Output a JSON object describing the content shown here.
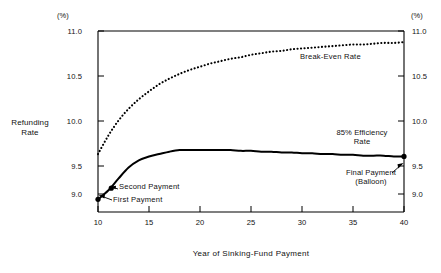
{
  "chart_data": {
    "type": "line",
    "title": "",
    "subtitle": "",
    "xlabel": "Year of Sinking-Fund Payment",
    "ylabel": "Refunding Rate",
    "unit_left": "(%)",
    "unit_right": "(%)",
    "xlim": [
      10,
      40
    ],
    "ylim": [
      8.72,
      11.0
    ],
    "grid": false,
    "legend_position": "inline-annotations",
    "xticks": [
      10,
      15,
      20,
      25,
      30,
      35,
      40
    ],
    "xtick_labels": [
      "10",
      "15",
      "20",
      "25",
      "30",
      "35",
      "40"
    ],
    "yticks": [
      11.0,
      10.5,
      10.0,
      9.5,
      9.0
    ],
    "ytick_labels": [
      "11.0",
      "10.5",
      "10.0",
      "9.5",
      "9.0"
    ],
    "ytick_labels_right": [
      "11.0",
      "10.5",
      "10.0",
      "9.5",
      "9.0"
    ],
    "series": [
      {
        "name": "Break-Even Rate",
        "style": "dotted",
        "color": "#000000",
        "x": [
          10,
          11,
          12,
          13,
          14,
          15,
          16,
          17,
          18,
          19,
          20,
          21,
          22,
          23,
          24,
          25,
          26,
          27,
          28,
          29,
          30,
          31,
          32,
          33,
          34,
          35,
          36,
          37,
          38,
          39,
          40
        ],
        "values": [
          9.45,
          9.68,
          9.87,
          10.02,
          10.14,
          10.24,
          10.33,
          10.4,
          10.46,
          10.51,
          10.55,
          10.59,
          10.62,
          10.65,
          10.67,
          10.7,
          10.72,
          10.74,
          10.75,
          10.77,
          10.78,
          10.79,
          10.8,
          10.81,
          10.82,
          10.83,
          10.83,
          10.84,
          10.85,
          10.85,
          10.86
        ]
      },
      {
        "name": "85% Efficiency Rate",
        "style": "solid",
        "color": "#000000",
        "x": [
          10,
          11,
          12,
          13,
          14,
          15,
          16,
          17,
          18,
          19,
          20,
          21,
          22,
          23,
          24,
          25,
          26,
          27,
          28,
          29,
          30,
          31,
          32,
          33,
          34,
          35,
          36,
          37,
          38,
          39,
          40
        ],
        "values": [
          8.88,
          8.99,
          9.14,
          9.28,
          9.37,
          9.42,
          9.45,
          9.48,
          9.5,
          9.5,
          9.5,
          9.5,
          9.5,
          9.5,
          9.49,
          9.49,
          9.48,
          9.48,
          9.47,
          9.47,
          9.46,
          9.46,
          9.45,
          9.45,
          9.44,
          9.44,
          9.43,
          9.43,
          9.43,
          9.42,
          9.42
        ]
      }
    ],
    "annotations": [
      {
        "label": "First Payment",
        "x": 10,
        "y": 8.88
      },
      {
        "label": "Second Payment",
        "x": 11.3,
        "y": 9.02
      },
      {
        "label": "Final Payment",
        "label2": "(Balloon)",
        "x": 40,
        "y": 9.42
      }
    ]
  },
  "axes": {
    "unit_left": "(%)",
    "unit_right": "(%)",
    "y_title_line1": "Refunding",
    "y_title_line2": "Rate",
    "x_title": "Year of Sinking-Fund Payment",
    "ytick_labels": [
      "11.0",
      "10.5",
      "10.0",
      "9.5",
      "9.0"
    ],
    "ytick_labels_right": [
      "11.0",
      "10.5",
      "10.0",
      "9.5",
      "9.0"
    ],
    "xtick_labels": [
      "10",
      "15",
      "20",
      "25",
      "30",
      "35",
      "40"
    ]
  },
  "labels": {
    "breakeven": "Break-Even Rate",
    "efficiency_line1": "85% Efficiency",
    "efficiency_line2": "Rate",
    "first_payment": "First Payment",
    "second_payment": "Second Payment",
    "final_payment_line1": "Final Payment",
    "final_payment_line2": "(Balloon)"
  }
}
